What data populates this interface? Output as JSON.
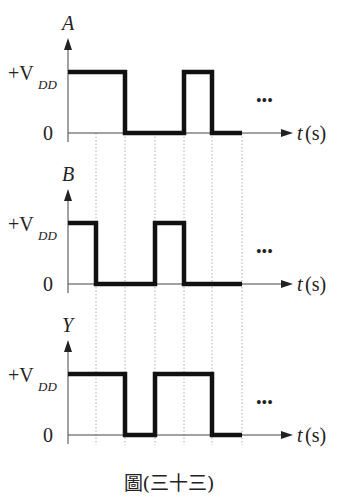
{
  "figure": {
    "caption": "圖(三十三)",
    "time_axis_label_var": "t",
    "time_axis_label_unit": "(s)",
    "high_label_prefix": "+V",
    "high_label_sub": "DD",
    "low_label": "0",
    "continuation": "•••",
    "time_ticks": [
      96,
      125,
      155,
      184,
      212,
      242
    ]
  },
  "signals": [
    {
      "name": "A",
      "levels": [
        1,
        1,
        0,
        0,
        1,
        0
      ]
    },
    {
      "name": "B",
      "levels": [
        1,
        0,
        0,
        1,
        0,
        0
      ]
    },
    {
      "name": "Y",
      "levels": [
        1,
        1,
        0,
        1,
        1,
        0
      ]
    }
  ],
  "colors": {
    "waveform": "#111111",
    "axis": "#444444",
    "grid": "#999999"
  }
}
